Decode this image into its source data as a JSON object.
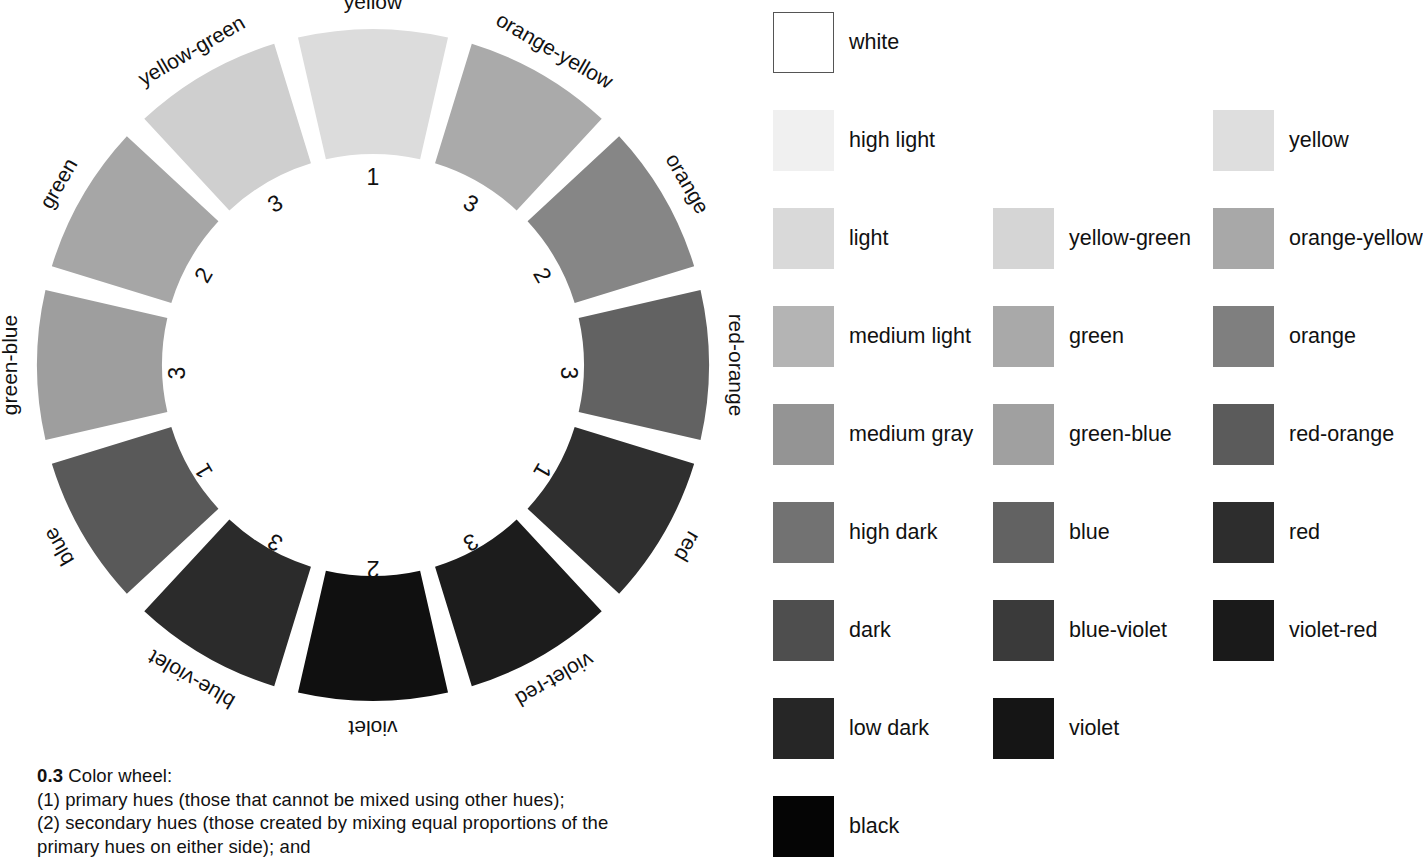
{
  "figure": {
    "caption_number": "0.3",
    "caption_title": "Color wheel:",
    "caption_lines": [
      "(1) primary hues (those that cannot be mixed using other hues);",
      "(2) secondary hues (those created by mixing equal proportions of the",
      "primary hues on either side); and"
    ]
  },
  "chart_data": {
    "type": "pie",
    "title": "Color wheel",
    "layout": {
      "center_x": 373,
      "center_y": 365,
      "outer_radius": 336,
      "inner_radius": 211,
      "segment_count": 12,
      "segment_gap_degrees": 4.2,
      "start_angle_degrees": -15,
      "label_radius": 356,
      "number_radius": 188,
      "grid": false,
      "legend_position": "right"
    },
    "categories": [
      "yellow",
      "orange-yellow",
      "orange",
      "red-orange",
      "red",
      "violet-red",
      "violet",
      "blue-violet",
      "blue",
      "green-blue",
      "green",
      "yellow-green"
    ],
    "values": [
      30,
      30,
      30,
      30,
      30,
      30,
      30,
      30,
      30,
      30,
      30,
      30
    ],
    "hue_ranks": [
      "1",
      "3",
      "2",
      "3",
      "1",
      "3",
      "2",
      "3",
      "1",
      "3",
      "2",
      "3"
    ],
    "colors": [
      "#dcdcdc",
      "#aaaaaa",
      "#868686",
      "#626262",
      "#2f2f2f",
      "#1c1c1c",
      "#101010",
      "#2b2b2b",
      "#595959",
      "#9e9e9e",
      "#a6a6a6",
      "#cfcfcf"
    ]
  },
  "wheel": {
    "segments": [
      {
        "label": "yellow",
        "number": "1",
        "color": "#dcdcdc"
      },
      {
        "label": "orange-yellow",
        "number": "3",
        "color": "#aaaaaa"
      },
      {
        "label": "orange",
        "number": "2",
        "color": "#868686"
      },
      {
        "label": "red-orange",
        "number": "3",
        "color": "#626262"
      },
      {
        "label": "red",
        "number": "1",
        "color": "#2f2f2f"
      },
      {
        "label": "violet-red",
        "number": "3",
        "color": "#1c1c1c"
      },
      {
        "label": "violet",
        "number": "2",
        "color": "#101010"
      },
      {
        "label": "blue-violet",
        "number": "3",
        "color": "#2b2b2b"
      },
      {
        "label": "blue",
        "number": "1",
        "color": "#595959"
      },
      {
        "label": "green-blue",
        "number": "3",
        "color": "#9e9e9e"
      },
      {
        "label": "green",
        "number": "2",
        "color": "#a6a6a6"
      },
      {
        "label": "yellow-green",
        "number": "3",
        "color": "#cfcfcf"
      }
    ]
  },
  "legend": {
    "columns": [
      {
        "name": "value-scale",
        "x": 773,
        "items": [
          {
            "label": "white",
            "color": "#ffffff",
            "bordered": true,
            "y": 12
          },
          {
            "label": "high light",
            "color": "#f0f0f0",
            "bordered": false,
            "y": 110
          },
          {
            "label": "light",
            "color": "#d9d9d9",
            "bordered": false,
            "y": 208
          },
          {
            "label": "medium light",
            "color": "#b4b4b4",
            "bordered": false,
            "y": 306
          },
          {
            "label": "medium gray",
            "color": "#949494",
            "bordered": false,
            "y": 404
          },
          {
            "label": "high dark",
            "color": "#727272",
            "bordered": false,
            "y": 502
          },
          {
            "label": "dark",
            "color": "#4e4e4e",
            "bordered": false,
            "y": 600
          },
          {
            "label": "low dark",
            "color": "#262626",
            "bordered": false,
            "y": 698
          },
          {
            "label": "black",
            "color": "#050505",
            "bordered": false,
            "y": 796
          }
        ]
      },
      {
        "name": "cool-hues",
        "x": 993,
        "items": [
          {
            "label": "yellow-green",
            "color": "#d5d5d5",
            "bordered": false,
            "y": 208
          },
          {
            "label": "green",
            "color": "#a9a9a9",
            "bordered": false,
            "y": 306
          },
          {
            "label": "green-blue",
            "color": "#a0a0a0",
            "bordered": false,
            "y": 404
          },
          {
            "label": "blue",
            "color": "#626262",
            "bordered": false,
            "y": 502
          },
          {
            "label": "blue-violet",
            "color": "#3a3a3a",
            "bordered": false,
            "y": 600
          },
          {
            "label": "violet",
            "color": "#151515",
            "bordered": false,
            "y": 698
          }
        ]
      },
      {
        "name": "warm-hues",
        "x": 1213,
        "items": [
          {
            "label": "yellow",
            "color": "#dedede",
            "bordered": false,
            "y": 110
          },
          {
            "label": "orange-yellow",
            "color": "#a8a8a8",
            "bordered": false,
            "y": 208
          },
          {
            "label": "orange",
            "color": "#7f7f7f",
            "bordered": false,
            "y": 306
          },
          {
            "label": "red-orange",
            "color": "#5b5b5b",
            "bordered": false,
            "y": 404
          },
          {
            "label": "red",
            "color": "#2d2d2d",
            "bordered": false,
            "y": 502
          },
          {
            "label": "violet-red",
            "color": "#1a1a1a",
            "bordered": false,
            "y": 600
          }
        ]
      }
    ]
  }
}
